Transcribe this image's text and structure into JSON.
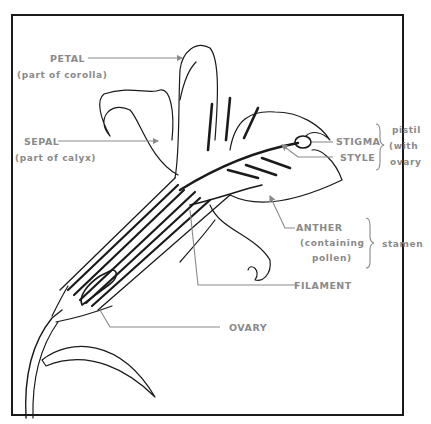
{
  "diagram": {
    "colors": {
      "line": "#1a1a1a",
      "label": "#8a8a8a",
      "background": "#ffffff"
    },
    "labels": {
      "petal": "PETAL",
      "petal_note": "(part of corolla)",
      "sepal": "SEPAL",
      "sepal_note": "(part of calyx)",
      "stigma": "STIGMA",
      "style": "STYLE",
      "pistil_line1": "pistil",
      "pistil_line2": "(with",
      "pistil_line3": "ovary",
      "anther": "ANTHER",
      "anther_note1": "(containing",
      "anther_note2": "pollen)",
      "stamen": "stamen",
      "filament": "FILAMENT",
      "ovary": "OVARY"
    },
    "groups": {
      "pistil": [
        "STIGMA",
        "STYLE",
        "OVARY"
      ],
      "stamen": [
        "ANTHER",
        "FILAMENT"
      ]
    }
  }
}
